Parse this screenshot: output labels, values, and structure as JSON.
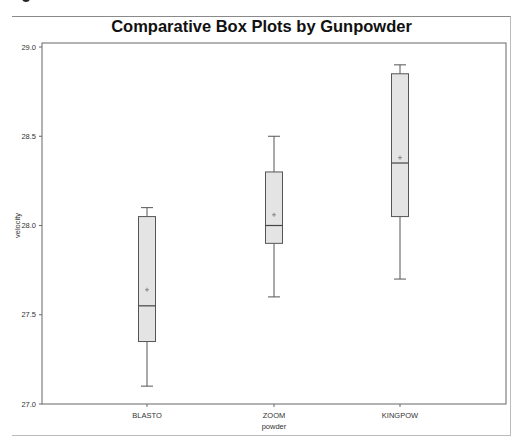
{
  "chart_data": {
    "type": "box",
    "title": "Comparative Box Plots by Gunpowder",
    "xlabel": "powder",
    "ylabel": "velocity",
    "ylim": [
      27.0,
      29.0
    ],
    "yticks": [
      "27.0",
      "27.5",
      "28.0",
      "28.5",
      "29.0"
    ],
    "categories": [
      "BLASTO",
      "ZOOM",
      "KINGPOW"
    ],
    "series": [
      {
        "name": "BLASTO",
        "min": 27.1,
        "q1": 27.35,
        "median": 27.55,
        "mean": 27.64,
        "q3": 28.05,
        "max": 28.1
      },
      {
        "name": "ZOOM",
        "min": 27.6,
        "q1": 27.9,
        "median": 28.0,
        "mean": 28.06,
        "q3": 28.3,
        "max": 28.5
      },
      {
        "name": "KINGPOW",
        "min": 27.7,
        "q1": 28.05,
        "median": 28.35,
        "mean": 28.38,
        "q3": 28.85,
        "max": 28.9
      }
    ],
    "grid": false,
    "legend": "none",
    "colors": {
      "box_fill": "#e4e4e4",
      "box_stroke": "#555555",
      "mean_marker": "#888888"
    }
  }
}
